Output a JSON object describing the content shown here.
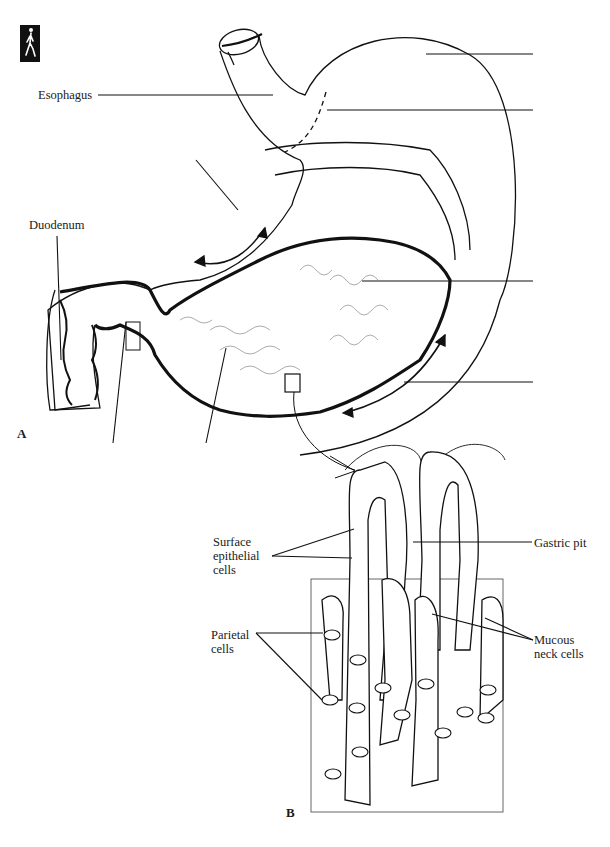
{
  "figure": {
    "panel_a_label": "A",
    "panel_b_label": "B",
    "icon": "walking-figure-icon",
    "colors": {
      "line": "#111111",
      "fine_line": "#777777",
      "background": "#ffffff"
    }
  },
  "panel_a": {
    "labels": {
      "esophagus": "Esophagus",
      "duodenum": "Duodenum"
    },
    "blank_leader_count": 8
  },
  "panel_b": {
    "labels": {
      "surface_epithelial": "Surface\nepithelial\ncells",
      "gastric_pit": "Gastric pit",
      "parietal": "Parietal\ncells",
      "mucous_neck": "Mucous\nneck cells"
    }
  }
}
